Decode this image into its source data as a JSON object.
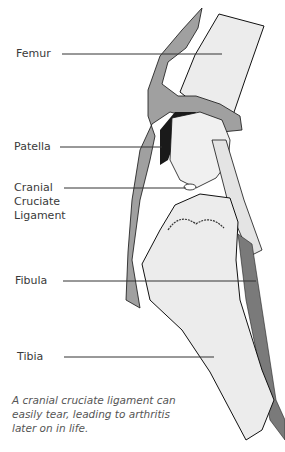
{
  "diagram": {
    "labels": [
      {
        "id": "femur",
        "text": "Femur"
      },
      {
        "id": "patella",
        "text": "Patella"
      },
      {
        "id": "cranial_cruciate_ligament",
        "lines": [
          "Cranial",
          "Cruciate",
          "Ligament"
        ]
      },
      {
        "id": "fibula",
        "text": "Fibula"
      },
      {
        "id": "tibia",
        "text": "Tibia"
      }
    ],
    "caption": "A cranial cruciate ligament can easily tear, leading to arthritis later on in life.",
    "colors": {
      "background": "#ffffff",
      "bone_fill": "#ececec",
      "tendon_fill": "#9a9a9a",
      "dark_shadow": "#1a1a1a",
      "outline": "#111111",
      "leader_line": "#333333",
      "label_text": "#3a3a3a",
      "caption_text": "#555555"
    }
  }
}
